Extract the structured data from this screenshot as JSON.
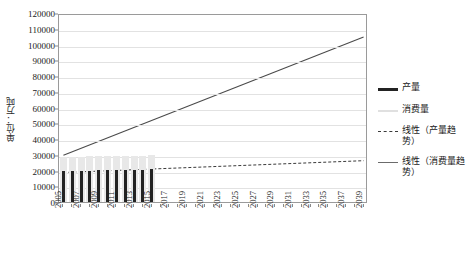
{
  "chart_data": {
    "type": "bar",
    "title": "",
    "xlabel": "",
    "ylabel": "单位：万吨",
    "ylim": [
      0,
      120000
    ],
    "ytick_labels": [
      "120000",
      "110000",
      "100000",
      "90000",
      "80000",
      "70000",
      "60000",
      "50000",
      "40000",
      "30000",
      "20000",
      "10000",
      "0"
    ],
    "ytick_values": [
      120000,
      110000,
      100000,
      90000,
      80000,
      70000,
      60000,
      50000,
      40000,
      30000,
      20000,
      10000,
      0
    ],
    "grid": true,
    "legend_position": "right",
    "x_start": 2005,
    "x_end": 2039,
    "categories": [
      "2005",
      "2006",
      "2007",
      "2008",
      "2009",
      "2010",
      "2011",
      "2012",
      "2013",
      "2014",
      "2015",
      "2016",
      "2017",
      "2018",
      "2019",
      "2020",
      "2021",
      "2022",
      "2023",
      "2024",
      "2025",
      "2026",
      "2027",
      "2028",
      "2029",
      "2030",
      "2031",
      "2032",
      "2033",
      "2034",
      "2035",
      "2036",
      "2037",
      "2038",
      "2039"
    ],
    "xtick_labels": [
      "2005",
      "2007",
      "2009",
      "2011",
      "2013",
      "2015",
      "2017",
      "2019",
      "2021",
      "2023",
      "2025",
      "2027",
      "2029",
      "2031",
      "2033",
      "2035",
      "2037",
      "2039"
    ],
    "series": [
      {
        "name": "产量",
        "type": "bar",
        "color": "#232323",
        "values": [
          19500,
          19700,
          19900,
          20000,
          20100,
          20200,
          20300,
          20400,
          20500,
          20600,
          20700,
          null,
          null,
          null,
          null,
          null,
          null,
          null,
          null,
          null,
          null,
          null,
          null,
          null,
          null,
          null,
          null,
          null,
          null,
          null,
          null,
          null,
          null,
          null,
          null
        ]
      },
      {
        "name": "消费量",
        "type": "bar",
        "color": "#e8e8e8",
        "values": [
          28500,
          28700,
          28800,
          28900,
          29000,
          29100,
          29200,
          29300,
          29400,
          29500,
          29600,
          null,
          null,
          null,
          null,
          null,
          null,
          null,
          null,
          null,
          null,
          null,
          null,
          null,
          null,
          null,
          null,
          null,
          null,
          null,
          null,
          null,
          null,
          null,
          null
        ]
      },
      {
        "name": "线性（产量趋势）",
        "type": "line",
        "style": "dashed",
        "color": "#3a3a3a",
        "y_start": 20000,
        "y_end": 27500
      },
      {
        "name": "线性（消费量趋势）",
        "type": "line",
        "style": "solid",
        "color": "#4a4a4a",
        "y_start": 31000,
        "y_end": 106000
      }
    ]
  },
  "legend": {
    "items": [
      {
        "label": "产量",
        "swatch": "output-bar-swatch"
      },
      {
        "label": "消费量",
        "swatch": "consume-bar-swatch"
      },
      {
        "label": "线性（产量趋势）",
        "swatch": "output-trend-swatch"
      },
      {
        "label": "线性（消费量趋势）",
        "swatch": "consume-trend-swatch"
      }
    ]
  }
}
